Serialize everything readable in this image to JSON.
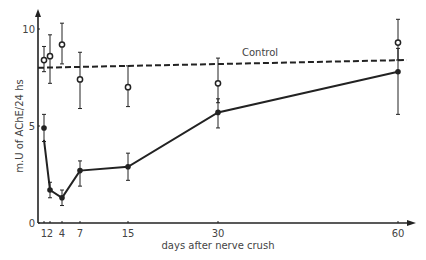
{
  "chart_data": {
    "type": "line",
    "title": "",
    "xlabel": "days after nerve crush",
    "ylabel": "m.U of AChE/24 hs",
    "xlim": [
      0,
      62
    ],
    "ylim": [
      0,
      11
    ],
    "x_ticks": [
      1,
      2,
      4,
      7,
      15,
      30,
      60
    ],
    "x_tick_labels": [
      "1",
      "2",
      "4",
      "7",
      "15",
      "30",
      "60"
    ],
    "y_ticks": [
      0,
      5,
      10
    ],
    "y_tick_labels": [
      "0",
      "5",
      "10"
    ],
    "grid": false,
    "legend": null,
    "annotations": [
      {
        "text": "Control",
        "x": 40,
        "y": 8.9
      }
    ],
    "series": [
      {
        "name": "Nerve crush (filled circles)",
        "marker": "filled-circle",
        "line": "solid",
        "x": [
          1,
          2,
          4,
          7,
          15,
          30,
          60
        ],
        "values": [
          4.9,
          1.7,
          1.3,
          2.7,
          2.9,
          5.7,
          7.8
        ],
        "error_low": [
          4.2,
          1.3,
          0.9,
          1.9,
          2.2,
          4.9,
          5.6
        ],
        "error_high": [
          5.6,
          2.1,
          1.7,
          3.2,
          3.6,
          6.4,
          9.0
        ]
      },
      {
        "name": "Control points (open circles)",
        "marker": "open-circle",
        "line": "none",
        "x": [
          1,
          2,
          4,
          7,
          15,
          30,
          60
        ],
        "values": [
          8.4,
          8.6,
          9.2,
          7.4,
          7.0,
          7.2,
          9.3
        ],
        "error_low": [
          7.8,
          7.2,
          8.2,
          5.9,
          6.0,
          6.2,
          8.4
        ],
        "error_high": [
          9.1,
          9.7,
          10.3,
          8.8,
          8.1,
          8.5,
          10.5
        ]
      },
      {
        "name": "Control",
        "marker": "none",
        "line": "dashed",
        "x": [
          0,
          61.5
        ],
        "values": [
          8.0,
          8.4
        ]
      }
    ]
  },
  "axes": {
    "xlabel": "days after nerve crush",
    "ylabel": "m.U of AChE/24 hs",
    "control_label": "Control"
  }
}
